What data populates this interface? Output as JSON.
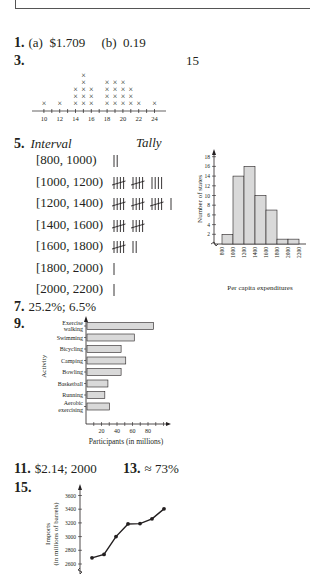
{
  "answers": {
    "a1": {
      "number": "1.",
      "text": "(a)  $1.709     (b)  0.19"
    },
    "a3": {
      "number": "3.",
      "side_number": "15"
    },
    "a5": {
      "number": "5.",
      "interval_header": "Interval",
      "tally_header": "Tally"
    },
    "a7": {
      "number": "7.",
      "text": "25.2%; 6.5%"
    },
    "a9": {
      "number": "9."
    },
    "a11": {
      "number": "11.",
      "text": "$2.14; 2000"
    },
    "a13": {
      "number": "13.",
      "text": "≈ 73%"
    },
    "a15": {
      "number": "15."
    }
  },
  "tally_table": [
    {
      "interval": "[800, 1000)",
      "tally": "||",
      "count": 2
    },
    {
      "interval": "[1000, 1200)",
      "tally": "̶|||| ̶|||| ||||",
      "count": 14
    },
    {
      "interval": "[1200, 1400)",
      "tally": "|||| |||| |||| |",
      "count": 16
    },
    {
      "interval": "[1400, 1600)",
      "tally": "|||| ||||",
      "count": 10
    },
    {
      "interval": "[1600, 1800)",
      "tally": "|||| ||",
      "count": 7
    },
    {
      "interval": "[1800, 2000)",
      "tally": "|",
      "count": 1
    },
    {
      "interval": "[2000, 2200)",
      "tally": "|",
      "count": 1
    }
  ],
  "chart_data": [
    {
      "type": "scatter",
      "subtype": "dot_plot",
      "title": "",
      "xlabel": "Quiz Scores",
      "ylabel": "",
      "x_tick_labels": [
        "10",
        "12",
        "14",
        "16",
        "18",
        "20",
        "22",
        "24"
      ],
      "x": [
        10,
        12,
        14,
        15,
        16,
        18,
        19,
        20,
        21,
        22,
        24
      ],
      "values": [
        1,
        1,
        3,
        5,
        3,
        4,
        4,
        4,
        3,
        1,
        1
      ],
      "marker": "×",
      "xlim": [
        9,
        25
      ]
    },
    {
      "type": "bar",
      "subtype": "histogram",
      "title": "",
      "xlabel": "Per capita expenditures",
      "ylabel": "Number of states",
      "categories": [
        "800-1000",
        "1000-1200",
        "1200-1400",
        "1400-1600",
        "1600-1800",
        "1800-2000",
        "2000-2200"
      ],
      "x_tick_labels": [
        "800",
        "1000",
        "1200",
        "1400",
        "1600",
        "1800",
        "2000",
        "2200"
      ],
      "y_tick_labels": [
        "2",
        "4",
        "6",
        "8",
        "10",
        "12",
        "14",
        "16",
        "18"
      ],
      "values": [
        2,
        14,
        16,
        10,
        7,
        1,
        1
      ],
      "ylim": [
        0,
        19
      ],
      "bar_color": "#d9d9d9"
    },
    {
      "type": "bar",
      "orientation": "horizontal",
      "title": "",
      "xlabel": "Participants (in millions)",
      "ylabel": "Activity",
      "categories": [
        "Exercise walking",
        "Swimming",
        "Bicycling",
        "Camping",
        "Bowling",
        "Basketball",
        "Running",
        "Aerobic exercising"
      ],
      "category_lines": [
        [
          "Exercise",
          "walking"
        ],
        [
          "Swimming"
        ],
        [
          "Bicycling"
        ],
        [
          "Camping"
        ],
        [
          "Bowling"
        ],
        [
          "Basketball"
        ],
        [
          "Running"
        ],
        [
          "Aerobic",
          "exercising"
        ]
      ],
      "values": [
        86,
        61,
        44,
        50,
        44,
        27,
        23,
        29
      ],
      "x_tick_labels": [
        "20",
        "40",
        "60",
        "80"
      ],
      "xlim": [
        0,
        100
      ],
      "bar_color": "#d9d9d9"
    },
    {
      "type": "line",
      "title": "",
      "xlabel": "",
      "ylabel": "Imports (in millions of barrels)",
      "ylabel_lines": [
        "Imports",
        "(in millions of barrels)"
      ],
      "y_tick_labels": [
        "2600",
        "2800",
        "3000",
        "3200",
        "3400",
        "3600"
      ],
      "values": [
        2690,
        2740,
        3000,
        3185,
        3190,
        3260,
        3405
      ],
      "ylim": [
        2550,
        3700
      ],
      "marker": "circle"
    }
  ]
}
